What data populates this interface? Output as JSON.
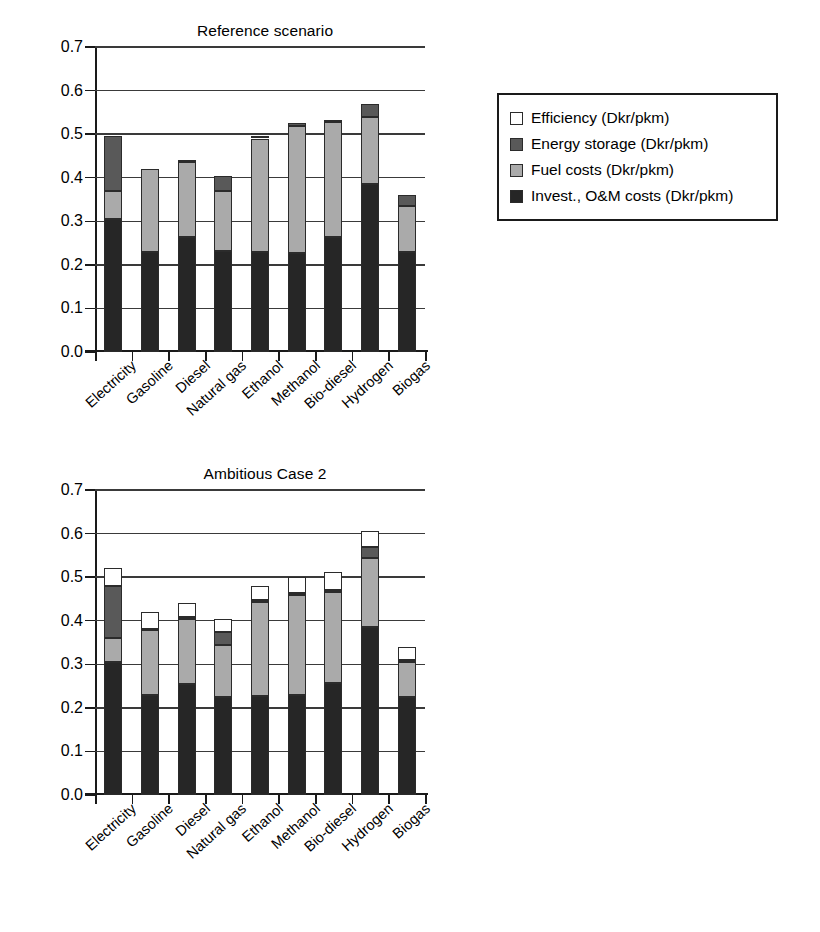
{
  "legend": {
    "items": [
      {
        "label": "Efficiency (Dkr/pkm)",
        "color": "#ffffff"
      },
      {
        "label": "Energy storage (Dkr/pkm)",
        "color": "#595959"
      },
      {
        "label": "Fuel costs (Dkr/pkm)",
        "color": "#aaaaaa"
      },
      {
        "label": "Invest., O&M costs (Dkr/pkm)",
        "color": "#262626"
      }
    ]
  },
  "chart_data": [
    {
      "type": "bar",
      "id": "reference-scenario",
      "stacked": true,
      "title": "Reference scenario",
      "xlabel": "",
      "ylabel": "",
      "ylim": [
        0.0,
        0.7
      ],
      "yticks": [
        "0.0",
        "0.1",
        "0.2",
        "0.3",
        "0.4",
        "0.5",
        "0.6",
        "0.7"
      ],
      "grid": true,
      "legend_position": "right",
      "categories": [
        "Electricity",
        "Gasoline",
        "Diesel",
        "Natural gas",
        "Ethanol",
        "Methanol",
        "Bio-diesel",
        "Hydrogen",
        "Biogas"
      ],
      "series": [
        {
          "name": "Invest., O&M costs (Dkr/pkm)",
          "color": "#262626",
          "values": [
            0.305,
            0.23,
            0.265,
            0.232,
            0.23,
            0.228,
            0.263,
            0.385,
            0.23
          ]
        },
        {
          "name": "Fuel costs (Dkr/pkm)",
          "color": "#aaaaaa",
          "values": [
            0.065,
            0.19,
            0.172,
            0.138,
            0.26,
            0.29,
            0.265,
            0.155,
            0.105
          ]
        },
        {
          "name": "Energy storage (Dkr/pkm)",
          "color": "#595959",
          "values": [
            0.125,
            0.0,
            0.003,
            0.033,
            0.005,
            0.007,
            0.005,
            0.03,
            0.025
          ]
        },
        {
          "name": "Efficiency (Dkr/pkm)",
          "color": "#ffffff",
          "values": [
            0.0,
            0.0,
            0.0,
            0.0,
            0.0,
            0.0,
            0.0,
            0.0,
            0.0
          ]
        }
      ],
      "totals": [
        0.495,
        0.42,
        0.44,
        0.403,
        0.495,
        0.525,
        0.533,
        0.57,
        0.36
      ]
    },
    {
      "type": "bar",
      "id": "ambitious-case-2",
      "stacked": true,
      "title": "Ambitious Case 2",
      "xlabel": "",
      "ylabel": "",
      "ylim": [
        0.0,
        0.7
      ],
      "yticks": [
        "0.0",
        "0.1",
        "0.2",
        "0.3",
        "0.4",
        "0.5",
        "0.6",
        "0.7"
      ],
      "grid": true,
      "legend_position": "right",
      "categories": [
        "Electricity",
        "Gasoline",
        "Diesel",
        "Natural gas",
        "Ethanol",
        "Methanol",
        "Bio-diesel",
        "Hydrogen",
        "Biogas"
      ],
      "series": [
        {
          "name": "Invest., O&M costs (Dkr/pkm)",
          "color": "#262626",
          "values": [
            0.305,
            0.23,
            0.255,
            0.225,
            0.228,
            0.23,
            0.258,
            0.385,
            0.225
          ]
        },
        {
          "name": "Fuel costs (Dkr/pkm)",
          "color": "#aaaaaa",
          "values": [
            0.055,
            0.148,
            0.15,
            0.12,
            0.215,
            0.228,
            0.208,
            0.16,
            0.08
          ]
        },
        {
          "name": "Energy storage (Dkr/pkm)",
          "color": "#595959",
          "values": [
            0.12,
            0.003,
            0.003,
            0.03,
            0.005,
            0.005,
            0.005,
            0.025,
            0.005
          ]
        },
        {
          "name": "Efficiency (Dkr/pkm)",
          "color": "#ffffff",
          "values": [
            0.04,
            0.04,
            0.032,
            0.03,
            0.032,
            0.038,
            0.04,
            0.035,
            0.03
          ]
        }
      ],
      "totals": [
        0.52,
        0.421,
        0.44,
        0.405,
        0.48,
        0.501,
        0.511,
        0.605,
        0.34
      ]
    }
  ]
}
